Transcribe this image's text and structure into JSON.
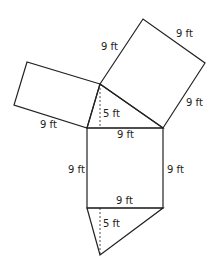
{
  "figure": {
    "labels": {
      "upper_right_top": "9 ft",
      "upper_right_left": "9 ft",
      "upper_right_right": "9 ft",
      "upper_left_bottom": "9 ft",
      "top_triangle_height": "5 ft",
      "square_top": "9 ft",
      "square_left": "9 ft",
      "square_right": "9 ft",
      "square_bottom": "9 ft",
      "bottom_triangle_height": "5 ft"
    },
    "colors": {
      "stroke": "#222222",
      "background": "#ffffff"
    }
  }
}
